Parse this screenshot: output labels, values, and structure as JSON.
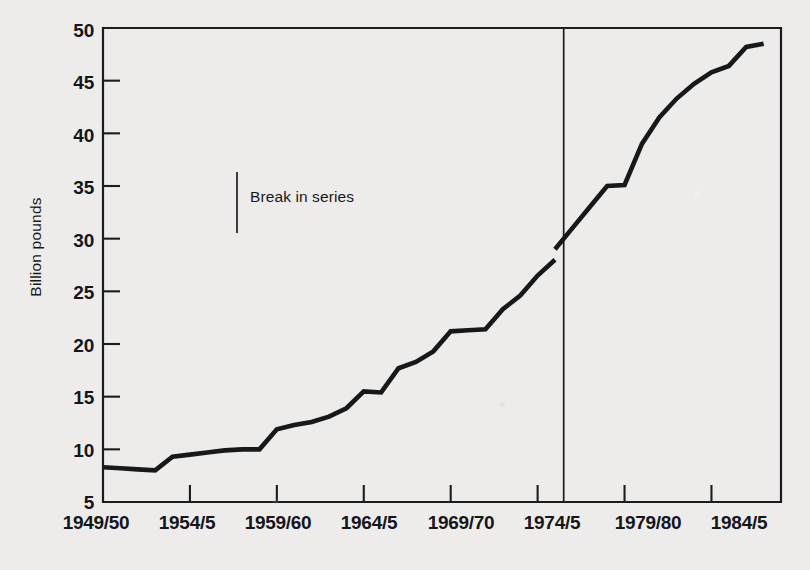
{
  "chart_data": {
    "type": "line",
    "title": "",
    "subtitle": "",
    "xlabel": "",
    "ylabel": "Billion pounds",
    "grid": false,
    "legend_position": "none",
    "ylim": [
      5,
      50
    ],
    "ytick_labels": [
      "50",
      "45",
      "40",
      "35",
      "30",
      "25",
      "20",
      "15",
      "10",
      "5"
    ],
    "ytick_values": [
      50,
      45,
      40,
      35,
      30,
      25,
      20,
      15,
      10,
      5
    ],
    "xtick_labels": [
      "1949/50",
      "1954/5",
      "1959/60",
      "1964/5",
      "1969/70",
      "1974/5",
      "1979/80",
      "1984/5"
    ],
    "xtick_values": [
      1949,
      1954,
      1959,
      1964,
      1969,
      1974,
      1979,
      1984
    ],
    "xlim": [
      1949,
      1988
    ],
    "annotations": [
      {
        "text": "Break in series",
        "marker": "vertical-line",
        "x": 1956.5,
        "y": 36.5
      }
    ],
    "break_in_series_at": 1975.5,
    "series": [
      {
        "name": "Expenditure",
        "x": [
          1949,
          1950,
          1951,
          1952,
          1953,
          1954,
          1955,
          1956,
          1957,
          1958,
          1959,
          1960,
          1961,
          1962,
          1963,
          1964,
          1965,
          1966,
          1967,
          1968,
          1969,
          1970,
          1971,
          1972,
          1973,
          1974,
          1975
        ],
        "values": [
          8.3,
          8.2,
          8.1,
          8.0,
          9.3,
          9.5,
          9.7,
          9.9,
          10.0,
          10.0,
          11.9,
          12.3,
          12.6,
          13.1,
          13.9,
          15.5,
          15.4,
          17.7,
          18.3,
          19.3,
          21.2,
          21.3,
          21.4,
          23.3,
          24.6,
          26.5,
          28.0
        ]
      },
      {
        "name": "Expenditure (revised basis)",
        "x": [
          1975,
          1976,
          1977,
          1978,
          1979,
          1980,
          1981,
          1982,
          1983,
          1984,
          1985,
          1986,
          1987
        ],
        "values": [
          29.0,
          31.0,
          33.0,
          35.0,
          35.1,
          39.0,
          41.5,
          43.3,
          44.7,
          45.8,
          46.4,
          48.2,
          48.5
        ]
      }
    ]
  }
}
